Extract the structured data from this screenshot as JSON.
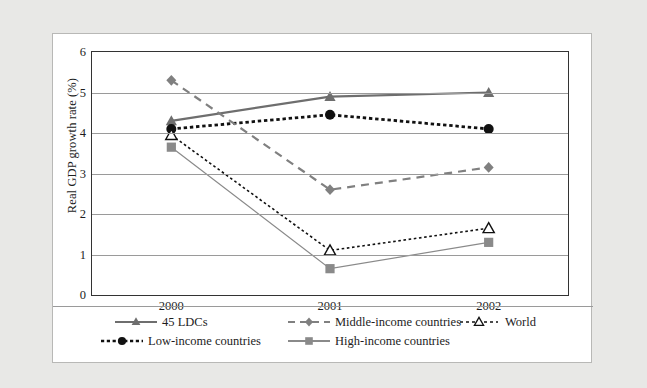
{
  "chart_data": {
    "type": "line",
    "title": "",
    "xlabel": "",
    "ylabel": "Real GDP growth rate (%)",
    "categories": [
      "2000",
      "2001",
      "2002"
    ],
    "x": [
      2000,
      2001,
      2002
    ],
    "ylim": [
      0,
      6
    ],
    "yticks": [
      "0",
      "1",
      "2",
      "3",
      "4",
      "5",
      "6"
    ],
    "ytick_values": [
      0,
      1,
      2,
      3,
      4,
      5,
      6
    ],
    "grid": true,
    "legend_position": "bottom",
    "series": [
      {
        "name": "45 LDCs",
        "values": [
          4.3,
          4.9,
          5.0
        ],
        "marker": "triangle",
        "marker_fill": "solid",
        "line_style": "solid",
        "color": "#6e6e6e"
      },
      {
        "name": "Low-income countries",
        "values": [
          4.1,
          4.45,
          4.1
        ],
        "marker": "circle",
        "marker_fill": "solid",
        "line_style": "dotted-thick",
        "color": "#111111"
      },
      {
        "name": "Middle-income countries",
        "values": [
          5.3,
          2.6,
          3.15
        ],
        "marker": "diamond",
        "marker_fill": "solid",
        "line_style": "dashed",
        "color": "#808080"
      },
      {
        "name": "High-income countries",
        "values": [
          3.65,
          0.65,
          1.3
        ],
        "marker": "square",
        "marker_fill": "solid",
        "line_style": "solid-thin",
        "color": "#8a8a8a"
      },
      {
        "name": "World",
        "values": [
          3.95,
          1.1,
          1.65
        ],
        "marker": "triangle",
        "marker_fill": "open",
        "line_style": "dotted-fine",
        "color": "#111111"
      }
    ]
  },
  "axis": {
    "y_title": "Real GDP growth rate (%)",
    "y_ticks": [
      "6",
      "5",
      "4",
      "3",
      "2",
      "1",
      "0"
    ],
    "x_ticks": [
      "2000",
      "2001",
      "2002"
    ]
  },
  "legend": {
    "items": [
      {
        "label": "45 LDCs"
      },
      {
        "label": "Low-income countries"
      },
      {
        "label": "Middle-income countries"
      },
      {
        "label": "High-income countries"
      },
      {
        "label": "World"
      }
    ]
  }
}
